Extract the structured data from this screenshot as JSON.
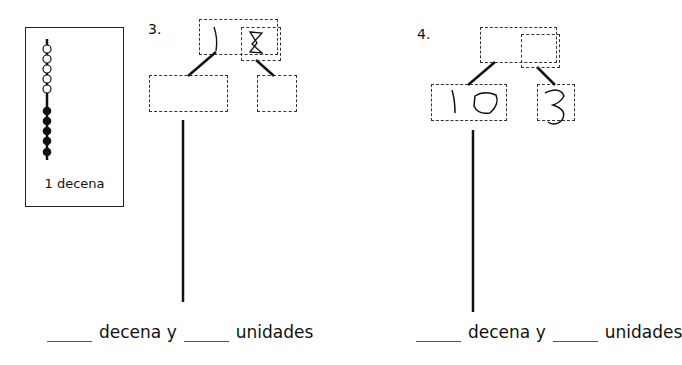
{
  "legend": {
    "label": "1 decena",
    "open_beads": 5,
    "filled_beads": 5
  },
  "problems": [
    {
      "number": "3.",
      "top_box": {
        "tens_value": "1",
        "ones_value": "8"
      },
      "bottom_left_box": {
        "value": ""
      },
      "bottom_right_box": {
        "value": ""
      },
      "sentence": {
        "blank1": "",
        "word1": "decena y",
        "blank2": "",
        "word2": "unidades"
      }
    },
    {
      "number": "4.",
      "top_box": {
        "tens_value": "",
        "ones_value": ""
      },
      "bottom_left_box": {
        "value": "10"
      },
      "bottom_right_box": {
        "value": "3"
      },
      "sentence": {
        "blank1": "",
        "word1": "decena y",
        "blank2": "",
        "word2": "unidades"
      }
    }
  ]
}
